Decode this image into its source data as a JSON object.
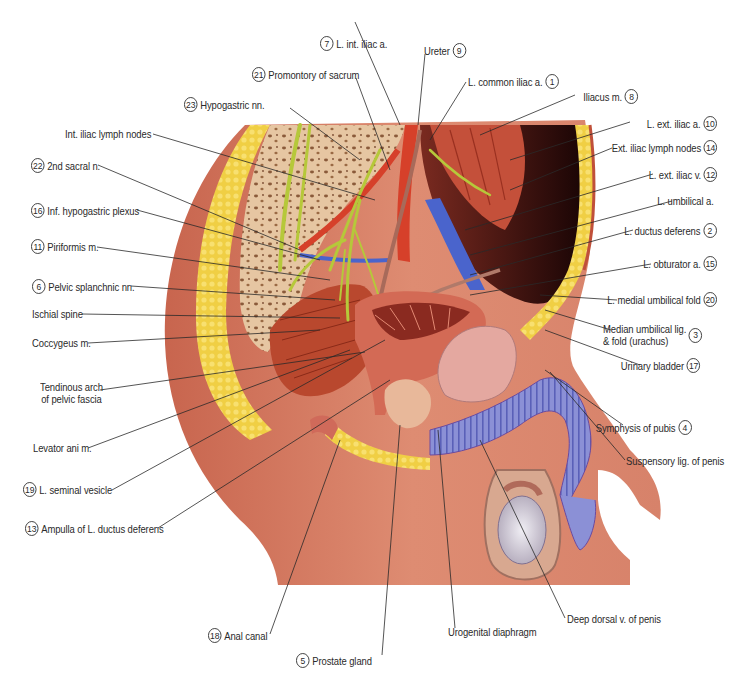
{
  "diagram": {
    "type": "anatomical-illustration",
    "colors": {
      "skin": "#d9826a",
      "skin_dark": "#b8604a",
      "fat": "#f2d24a",
      "bone": "#e8c9a8",
      "muscle": "#c44a30",
      "nerve": "#b8c83a",
      "vein": "#4a6ad0",
      "artery": "#d83a28",
      "erectile_tissue": "#8a90d8",
      "bladder": "#e8a8a0",
      "cavity": "#2a0a0a",
      "leader_line": "#2a2a2a"
    }
  },
  "labels": [
    {
      "id": "l7",
      "num": "7",
      "text": "L. int. iliac a.",
      "side": "top"
    },
    {
      "id": "l9",
      "num": "9",
      "text": "Ureter",
      "side": "top"
    },
    {
      "id": "l21",
      "num": "21",
      "text": "Promontory of sacrum",
      "side": "top"
    },
    {
      "id": "l1",
      "num": "1",
      "text": "L. common iliac a.",
      "side": "top"
    },
    {
      "id": "l23",
      "num": "23",
      "text": "Hypogastric nn.",
      "side": "top"
    },
    {
      "id": "l8",
      "num": "8",
      "text": "Iliacus m.",
      "side": "right"
    },
    {
      "id": "lInt",
      "num": "",
      "text": "Int. iliac lymph nodes",
      "side": "left"
    },
    {
      "id": "l10",
      "num": "10",
      "text": "L. ext. iliac a.",
      "side": "right"
    },
    {
      "id": "l22",
      "num": "22",
      "text": "2nd sacral n.",
      "side": "left"
    },
    {
      "id": "l14",
      "num": "14",
      "text": "Ext. iliac lymph nodes",
      "side": "right"
    },
    {
      "id": "l12",
      "num": "12",
      "text": "L. ext. iliac v.",
      "side": "right"
    },
    {
      "id": "l16",
      "num": "16",
      "text": "Inf. hypogastric plexus",
      "side": "left"
    },
    {
      "id": "lUmb",
      "num": "",
      "text": "L. umbilical a.",
      "side": "right"
    },
    {
      "id": "l11",
      "num": "11",
      "text": "Piriformis m.",
      "side": "left"
    },
    {
      "id": "l2",
      "num": "2",
      "text": "L. ductus deferens",
      "side": "right"
    },
    {
      "id": "l15",
      "num": "15",
      "text": "L. obturator a.",
      "side": "right"
    },
    {
      "id": "l6",
      "num": "6",
      "text": "Pelvic splanchnic nn.",
      "side": "left"
    },
    {
      "id": "l20",
      "num": "20",
      "text": "L. medial umbilical fold",
      "side": "right"
    },
    {
      "id": "lIsc",
      "num": "",
      "text": "Ischial spine",
      "side": "left"
    },
    {
      "id": "l3",
      "num": "3",
      "text": "Median umbilical lig.",
      "text2": "& fold (urachus)",
      "side": "right"
    },
    {
      "id": "lCoc",
      "num": "",
      "text": "Coccygeus m.",
      "side": "left"
    },
    {
      "id": "l17",
      "num": "17",
      "text": "Urinary bladder",
      "side": "right"
    },
    {
      "id": "lTen",
      "num": "",
      "text": "Tendinous arch",
      "text2": "of pelvic fascia",
      "side": "left"
    },
    {
      "id": "l4",
      "num": "4",
      "text": "Symphysis of pubis",
      "side": "right"
    },
    {
      "id": "lLev",
      "num": "",
      "text": "Levator ani m.",
      "side": "left"
    },
    {
      "id": "lSus",
      "num": "",
      "text": "Suspensory lig. of penis",
      "side": "right"
    },
    {
      "id": "l19",
      "num": "19",
      "text": "L. seminal vesicle",
      "side": "left"
    },
    {
      "id": "l13",
      "num": "13",
      "text": "Ampulla of L. ductus deferens",
      "side": "left"
    },
    {
      "id": "lDdv",
      "num": "",
      "text": "Deep dorsal v. of penis",
      "side": "bottom"
    },
    {
      "id": "l18",
      "num": "18",
      "text": "Anal canal",
      "side": "bottom"
    },
    {
      "id": "lUro",
      "num": "",
      "text": "Urogenital diaphragm",
      "side": "bottom"
    },
    {
      "id": "l5",
      "num": "5",
      "text": "Prostate gland",
      "side": "bottom"
    }
  ]
}
